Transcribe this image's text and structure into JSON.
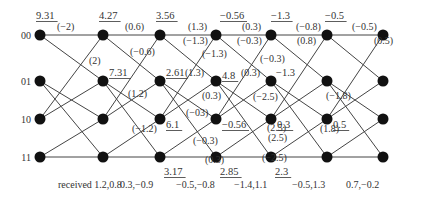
{
  "diagram": {
    "type": "viterbi-trellis",
    "states": [
      "00",
      "01",
      "10",
      "11"
    ],
    "columns": 7,
    "column_x": [
      40,
      103,
      160,
      216,
      271,
      327,
      383
    ],
    "row_y": [
      35,
      81,
      119,
      157
    ],
    "transitions": [
      [
        0,
        0
      ],
      [
        0,
        1
      ],
      [
        1,
        2
      ],
      [
        1,
        3
      ],
      [
        2,
        0
      ],
      [
        2,
        1
      ],
      [
        3,
        2
      ],
      [
        3,
        3
      ]
    ],
    "path_metrics": [
      {
        "col": 0,
        "row": 0,
        "text": "9.31",
        "underline": true,
        "dx": -4,
        "dy": -16
      },
      {
        "col": 1,
        "row": 0,
        "text": "4.27",
        "underline": true,
        "dx": -4,
        "dy": -16
      },
      {
        "col": 1,
        "row": 1,
        "text": "7.31",
        "underline": true,
        "dx": 6,
        "dy": -5
      },
      {
        "col": 2,
        "row": 0,
        "text": "3.56",
        "underline": true,
        "dx": -4,
        "dy": -16
      },
      {
        "col": 2,
        "row": 1,
        "text": "2.61",
        "underline": true,
        "dx": 6,
        "dy": -5
      },
      {
        "col": 2,
        "row": 2,
        "text": "6.1",
        "underline": true,
        "dx": 6,
        "dy": 9
      },
      {
        "col": 2,
        "row": 3,
        "text": "3.17",
        "underline": true,
        "dx": 4,
        "dy": 18
      },
      {
        "col": 3,
        "row": 0,
        "text": "−0.56",
        "underline": true,
        "dx": 4,
        "dy": -16
      },
      {
        "col": 3,
        "row": 1,
        "text": "4.8",
        "underline": true,
        "dx": 6,
        "dy": -2
      },
      {
        "col": 3,
        "row": 2,
        "text": "−0.56",
        "underline": true,
        "dx": 6,
        "dy": 9
      },
      {
        "col": 3,
        "row": 3,
        "text": "2.85",
        "underline": true,
        "dx": 4,
        "dy": 18
      },
      {
        "col": 4,
        "row": 0,
        "text": "−1.3",
        "underline": true,
        "dx": 0,
        "dy": -16
      },
      {
        "col": 4,
        "row": 1,
        "text": "−1.3",
        "underline": false,
        "dx": 5,
        "dy": -5
      },
      {
        "col": 4,
        "row": 2,
        "text": "0.3",
        "underline": true,
        "dx": 6,
        "dy": 9
      },
      {
        "col": 4,
        "row": 3,
        "text": "2.3",
        "underline": true,
        "dx": 4,
        "dy": 18
      },
      {
        "col": 5,
        "row": 0,
        "text": "−0.5",
        "underline": true,
        "dx": -2,
        "dy": -16
      },
      {
        "col": 5,
        "row": 2,
        "text": "0.5",
        "underline": true,
        "dx": 6,
        "dy": 9
      }
    ],
    "branch_metrics": [
      {
        "x": 57,
        "y": 34,
        "text": "(−2)"
      },
      {
        "x": 89,
        "y": 68,
        "text": "(2)"
      },
      {
        "x": 125,
        "y": 34,
        "text": "(0.6)"
      },
      {
        "x": 130,
        "y": 59,
        "text": "(−0.6)"
      },
      {
        "x": 128,
        "y": 101,
        "text": "(1.2)"
      },
      {
        "x": 132,
        "y": 136,
        "text": "(−1.2)"
      },
      {
        "x": 188,
        "y": 34,
        "text": "(1.3)"
      },
      {
        "x": 183,
        "y": 48,
        "text": "(−1.3)"
      },
      {
        "x": 202,
        "y": 61,
        "text": "(−1.3)"
      },
      {
        "x": 185,
        "y": 80,
        "text": "(1.3)"
      },
      {
        "x": 202,
        "y": 103,
        "text": "(0.3)"
      },
      {
        "x": 186,
        "y": 120,
        "text": "(−03)"
      },
      {
        "x": 193,
        "y": 148,
        "text": "(−0.3)"
      },
      {
        "x": 205,
        "y": 167,
        "text": "(0.3)"
      },
      {
        "x": 242,
        "y": 34,
        "text": "(0.3)"
      },
      {
        "x": 237,
        "y": 48,
        "text": "(−0.3)"
      },
      {
        "x": 260,
        "y": 66,
        "text": "(−0.3)"
      },
      {
        "x": 241,
        "y": 80,
        "text": "(0.3)"
      },
      {
        "x": 253,
        "y": 104,
        "text": "(−2.5)"
      },
      {
        "x": 267,
        "y": 135,
        "text": "(2.5)"
      },
      {
        "x": 268,
        "y": 145,
        "text": "(2.5)"
      },
      {
        "x": 262,
        "y": 165,
        "text": "(−2.5)"
      },
      {
        "x": 296,
        "y": 34,
        "text": "(−0.8)"
      },
      {
        "x": 297,
        "y": 48,
        "text": "(0.8)"
      },
      {
        "x": 326,
        "y": 103,
        "text": "(−1.8)"
      },
      {
        "x": 320,
        "y": 136,
        "text": "(1.8)"
      },
      {
        "x": 352,
        "y": 34,
        "text": "(−0.5)"
      },
      {
        "x": 374,
        "y": 48,
        "text": "(0.5)"
      }
    ],
    "received": [
      {
        "x": 58,
        "text": "received 1.2,0.8"
      },
      {
        "x": 120,
        "text": "0.3,−0.9"
      },
      {
        "x": 176,
        "text": "−0.5,−0.8"
      },
      {
        "x": 234,
        "text": "−1.4,1.1"
      },
      {
        "x": 292,
        "text": "−0.5,1.3"
      },
      {
        "x": 346,
        "text": "0.7,−0.2"
      }
    ],
    "received_y": 188
  }
}
